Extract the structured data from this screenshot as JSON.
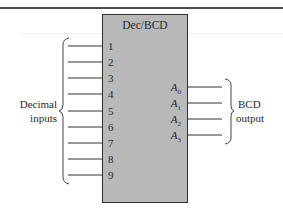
{
  "diagram": {
    "block": {
      "title": "Dec/BCD",
      "fill_color": "#b9b9b9",
      "border_color": "#2e2e2e"
    },
    "inputs": {
      "group_label_line1": "Decimal",
      "group_label_line2": "inputs",
      "pins": [
        {
          "label": "1",
          "y": 46
        },
        {
          "label": "2",
          "y": 62
        },
        {
          "label": "3",
          "y": 78
        },
        {
          "label": "4",
          "y": 94
        },
        {
          "label": "5",
          "y": 111
        },
        {
          "label": "6",
          "y": 127
        },
        {
          "label": "7",
          "y": 143
        },
        {
          "label": "8",
          "y": 159
        },
        {
          "label": "9",
          "y": 175
        }
      ]
    },
    "outputs": {
      "group_label_line1": "BCD",
      "group_label_line2": "output",
      "pins": [
        {
          "base": "A",
          "sub": "0",
          "y": 87
        },
        {
          "base": "A",
          "sub": "1",
          "y": 103
        },
        {
          "base": "A",
          "sub": "2",
          "y": 119
        },
        {
          "base": "A",
          "sub": "3",
          "y": 135
        }
      ]
    }
  }
}
